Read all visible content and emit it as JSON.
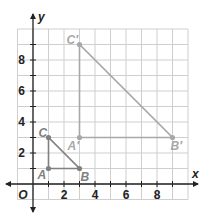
{
  "axes": {
    "x_label": "x",
    "y_label": "y",
    "origin_label": "O",
    "x_ticks": [
      "2",
      "4",
      "6",
      "8"
    ],
    "y_ticks": [
      "2",
      "4",
      "6",
      "8"
    ]
  },
  "colors": {
    "grid": "#cfcfcf",
    "axis": "#222222",
    "small_triangle": "#808080",
    "image_triangle": "#a8a8a8"
  },
  "triangle_ABC": {
    "points": [
      {
        "label": "A",
        "x": 1,
        "y": 1
      },
      {
        "label": "B",
        "x": 3,
        "y": 1
      },
      {
        "label": "C",
        "x": 1,
        "y": 3
      }
    ]
  },
  "triangle_image": {
    "points": [
      {
        "label": "A′",
        "x": 3,
        "y": 3
      },
      {
        "label": "B′",
        "x": 9,
        "y": 3
      },
      {
        "label": "C′",
        "x": 3,
        "y": 9
      }
    ]
  }
}
